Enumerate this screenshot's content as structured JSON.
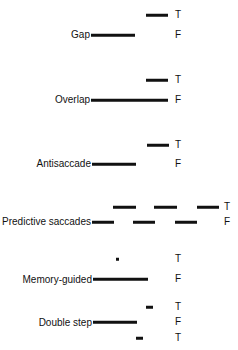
{
  "diagram": {
    "letter_x": 175,
    "panels": [
      {
        "name": "Gap",
        "label_y": 35,
        "rows": [
          {
            "letter": "T",
            "y": 15,
            "segments": [
              [
                146,
                168
              ]
            ]
          },
          {
            "letter": "F",
            "y": 35,
            "segments": [
              [
                91,
                135
              ]
            ]
          }
        ]
      },
      {
        "name": "Overlap",
        "label_y": 100,
        "rows": [
          {
            "letter": "T",
            "y": 80,
            "segments": [
              [
                146,
                168
              ]
            ]
          },
          {
            "letter": "F",
            "y": 100,
            "segments": [
              [
                91,
                168
              ]
            ]
          }
        ]
      },
      {
        "name": "Antisaccade",
        "label_y": 164,
        "rows": [
          {
            "letter": "T",
            "y": 145,
            "segments": [
              [
                147,
                169
              ]
            ]
          },
          {
            "letter": "F",
            "y": 164,
            "segments": [
              [
                92,
                136
              ]
            ]
          }
        ]
      },
      {
        "name": "Predictive saccades",
        "label_y": 222,
        "letter_x": 224,
        "rows": [
          {
            "letter": "T",
            "y": 207,
            "segments": [
              [
                113,
                136
              ],
              [
                154,
                177
              ],
              [
                197,
                219
              ]
            ]
          },
          {
            "letter": "F",
            "y": 222,
            "segments": [
              [
                92,
                114
              ],
              [
                133,
                155
              ],
              [
                175,
                197
              ]
            ]
          }
        ]
      },
      {
        "name": "Memory-guided",
        "label_y": 280,
        "rows": [
          {
            "letter": "T",
            "y": 259,
            "segments": [
              [
                116,
                119
              ]
            ]
          },
          {
            "letter": "F",
            "y": 279,
            "segments": [
              [
                93,
                148
              ]
            ]
          }
        ]
      },
      {
        "name": "Double step",
        "label_y": 323,
        "rows": [
          {
            "letter": "T",
            "y": 307,
            "segments": [
              [
                146,
                153
              ]
            ]
          },
          {
            "letter": "F",
            "y": 322,
            "segments": [
              [
                93,
                137
              ]
            ]
          },
          {
            "letter": "T",
            "y": 338,
            "segments": [
              [
                136,
                143
              ]
            ]
          }
        ]
      }
    ]
  }
}
